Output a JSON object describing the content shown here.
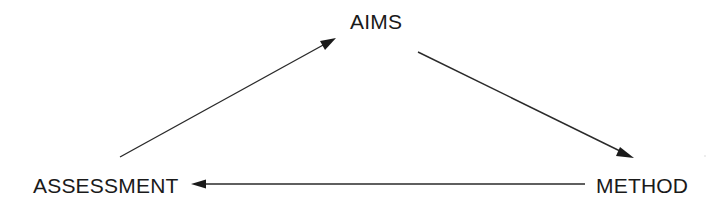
{
  "diagram": {
    "type": "cycle",
    "nodes": [
      {
        "id": "aims",
        "label": "AIMS"
      },
      {
        "id": "method",
        "label": "METHOD"
      },
      {
        "id": "assessment",
        "label": "ASSESSMENT"
      }
    ],
    "edges": [
      {
        "from": "assessment",
        "to": "aims"
      },
      {
        "from": "aims",
        "to": "method"
      },
      {
        "from": "method",
        "to": "assessment"
      }
    ],
    "colors": {
      "text": "#1a1a1a",
      "line": "#2a2a2a",
      "background": "#ffffff"
    }
  }
}
